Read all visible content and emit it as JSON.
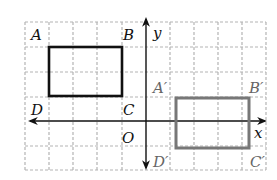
{
  "diagram": {
    "type": "coordinate-grid-translation",
    "grid": {
      "columns": 10,
      "rows": 6,
      "cell_size_px": 24.2,
      "origin_px": [
        146,
        121
      ],
      "line_style": "dashed",
      "line_color": "#b0b0b0"
    },
    "axes": {
      "x_label": "x",
      "y_label": "y",
      "origin_label": "O",
      "x_arrows": "both",
      "y_arrows": "both",
      "color": "#111111"
    },
    "original_rectangle": {
      "name": "ABCD",
      "color": "#111111",
      "vertices": {
        "A": {
          "label": "A",
          "grid": [
            -4,
            4
          ]
        },
        "B": {
          "label": "B",
          "grid": [
            -1,
            4
          ]
        },
        "C": {
          "label": "C",
          "grid": [
            -1,
            1
          ]
        },
        "D": {
          "label": "D",
          "grid": [
            -4,
            1
          ]
        }
      },
      "rect_grid": {
        "x_from": -4,
        "x_to": -1,
        "y_from": 1,
        "y_to": 3
      }
    },
    "image_rectangle": {
      "name": "A'B'C'D'",
      "color": "#777777",
      "vertices": {
        "A_prime": {
          "label": "A′",
          "grid": [
            1,
            1
          ]
        },
        "B_prime": {
          "label": "B′",
          "grid": [
            4,
            1
          ]
        },
        "C_prime": {
          "label": "C′",
          "grid": [
            4,
            -2
          ]
        },
        "D_prime": {
          "label": "D′",
          "grid": [
            0,
            -2
          ]
        }
      },
      "rect_grid": {
        "x_from": 1.25,
        "x_to": 4.3,
        "y_from": -1.1,
        "y_to": 0.95
      }
    }
  }
}
